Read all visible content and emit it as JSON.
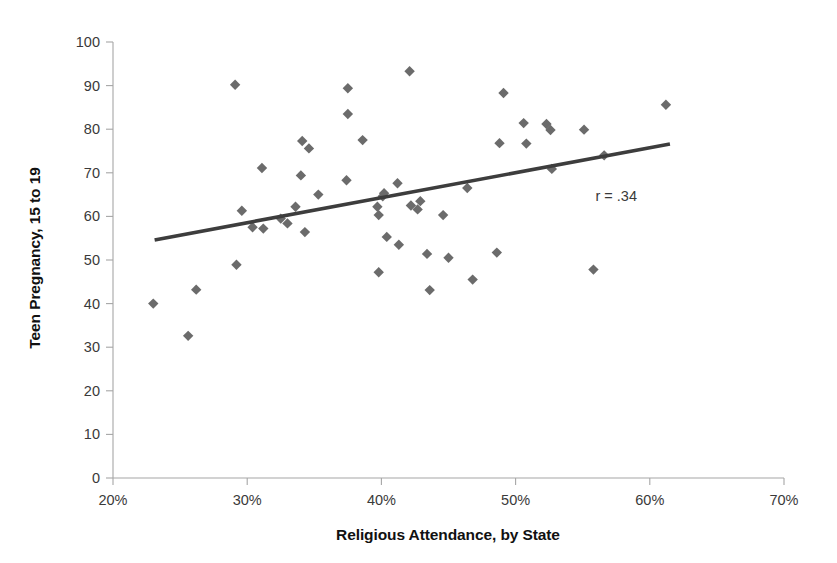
{
  "chart_data": {
    "type": "scatter",
    "title": "",
    "xlabel": "Religious Attendance, by State",
    "ylabel": "Teen Pregnancy, 15 to 19",
    "xlim": [
      20,
      70
    ],
    "ylim": [
      0,
      100
    ],
    "xticks": [
      20,
      30,
      40,
      50,
      60,
      70
    ],
    "xtick_labels": [
      "20%",
      "30%",
      "40%",
      "50%",
      "60%",
      "70%"
    ],
    "yticks": [
      0,
      10,
      20,
      30,
      40,
      50,
      60,
      70,
      80,
      90,
      100
    ],
    "ytick_labels": [
      "0",
      "10",
      "20",
      "30",
      "40",
      "50",
      "60",
      "70",
      "80",
      "90",
      "100"
    ],
    "grid": false,
    "legend": false,
    "annotations": [
      {
        "text": "r = .34",
        "x": 57.5,
        "y": 63.5
      }
    ],
    "marker_shape": "diamond",
    "marker_color": "#6b6b6b",
    "trendline": {
      "color": "#3d3d3d",
      "x0": 23.1,
      "y0": 54.6,
      "x1": 61.5,
      "y1": 76.6
    },
    "series": [
      {
        "name": "States",
        "points": [
          [
            23.0,
            40.0
          ],
          [
            25.6,
            32.6
          ],
          [
            26.2,
            43.2
          ],
          [
            29.2,
            48.9
          ],
          [
            29.1,
            90.2
          ],
          [
            29.6,
            61.3
          ],
          [
            31.1,
            71.1
          ],
          [
            30.4,
            57.5
          ],
          [
            31.2,
            57.2
          ],
          [
            32.5,
            59.5
          ],
          [
            33.0,
            58.4
          ],
          [
            33.6,
            62.2
          ],
          [
            34.0,
            69.4
          ],
          [
            34.1,
            77.3
          ],
          [
            34.6,
            75.6
          ],
          [
            34.3,
            56.4
          ],
          [
            35.3,
            65.0
          ],
          [
            37.5,
            89.4
          ],
          [
            37.5,
            83.5
          ],
          [
            37.4,
            68.3
          ],
          [
            38.6,
            77.5
          ],
          [
            39.7,
            62.2
          ],
          [
            39.8,
            60.3
          ],
          [
            39.8,
            47.2
          ],
          [
            40.1,
            64.6
          ],
          [
            40.2,
            65.3
          ],
          [
            40.4,
            55.3
          ],
          [
            41.2,
            67.6
          ],
          [
            41.3,
            53.5
          ],
          [
            42.1,
            93.3
          ],
          [
            42.2,
            62.5
          ],
          [
            42.7,
            61.6
          ],
          [
            42.9,
            63.5
          ],
          [
            43.6,
            43.1
          ],
          [
            43.4,
            51.4
          ],
          [
            44.6,
            60.3
          ],
          [
            45.0,
            50.5
          ],
          [
            46.8,
            45.5
          ],
          [
            46.4,
            66.5
          ],
          [
            48.6,
            51.7
          ],
          [
            48.8,
            76.8
          ],
          [
            49.1,
            88.3
          ],
          [
            50.6,
            81.4
          ],
          [
            50.8,
            76.7
          ],
          [
            52.3,
            81.2
          ],
          [
            52.6,
            79.8
          ],
          [
            52.7,
            70.9
          ],
          [
            55.1,
            79.9
          ],
          [
            55.8,
            47.8
          ],
          [
            56.6,
            74.0
          ],
          [
            61.2,
            85.6
          ]
        ]
      }
    ]
  }
}
